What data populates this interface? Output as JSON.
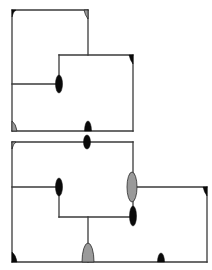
{
  "colors": {
    "background": "#ffffff",
    "line": "#3a3a3a",
    "marker_black": "#0a0a0a",
    "marker_grey": "#9a9a9a"
  },
  "diagrams": [
    {
      "name": "floorplan-top",
      "walls": [
        [
          12,
          10,
          88,
          10
        ],
        [
          12,
          10,
          12,
          131
        ],
        [
          12,
          131,
          133,
          131
        ],
        [
          88,
          10,
          88,
          55
        ],
        [
          59,
          55,
          133,
          55
        ],
        [
          133,
          55,
          133,
          131
        ],
        [
          59,
          55,
          59,
          84
        ],
        [
          12,
          84,
          59,
          84
        ]
      ],
      "markers": [
        {
          "type": "corner",
          "color": "black",
          "x": 12,
          "y": 10,
          "dir": "tl"
        },
        {
          "type": "corner",
          "color": "grey",
          "x": 88,
          "y": 10,
          "dir": "tr"
        },
        {
          "type": "ellipse",
          "color": "black",
          "x": 59,
          "y": 84,
          "rx": 3.5,
          "ry": 9
        },
        {
          "type": "corner",
          "color": "black",
          "x": 133,
          "y": 55,
          "dir": "tr"
        },
        {
          "type": "corner",
          "color": "grey",
          "x": 12,
          "y": 131,
          "dir": "bl"
        },
        {
          "type": "half",
          "color": "black",
          "x": 88,
          "y": 131,
          "rx": 3.5,
          "ry": 10
        }
      ]
    },
    {
      "name": "floorplan-bottom",
      "walls": [
        [
          12,
          142,
          133,
          142
        ],
        [
          12,
          142,
          12,
          262
        ],
        [
          12,
          262,
          207,
          262
        ],
        [
          133,
          142,
          133,
          217
        ],
        [
          12,
          187,
          59,
          187
        ],
        [
          59,
          187,
          59,
          217
        ],
        [
          59,
          217,
          133,
          217
        ],
        [
          133,
          187,
          207,
          187
        ],
        [
          207,
          187,
          207,
          262
        ],
        [
          88,
          217,
          88,
          262
        ]
      ],
      "markers": [
        {
          "type": "corner",
          "color": "grey",
          "x": 12,
          "y": 142,
          "dir": "tl"
        },
        {
          "type": "ellipse",
          "color": "black",
          "x": 87,
          "y": 142,
          "rx": 3.5,
          "ry": 7
        },
        {
          "type": "ellipse",
          "color": "black",
          "x": 59,
          "y": 187,
          "rx": 3.5,
          "ry": 9
        },
        {
          "type": "ellipse",
          "color": "grey",
          "x": 132,
          "y": 187,
          "rx": 5,
          "ry": 15
        },
        {
          "type": "ellipse",
          "color": "black",
          "x": 133,
          "y": 216,
          "rx": 3.5,
          "ry": 10
        },
        {
          "type": "corner",
          "color": "black",
          "x": 207,
          "y": 187,
          "dir": "tr"
        },
        {
          "type": "corner",
          "color": "black",
          "x": 12,
          "y": 262,
          "dir": "bl"
        },
        {
          "type": "half",
          "color": "grey",
          "x": 88,
          "y": 262,
          "rx": 6,
          "ry": 19
        },
        {
          "type": "half",
          "color": "black",
          "x": 161,
          "y": 262,
          "rx": 3.5,
          "ry": 9
        }
      ]
    }
  ]
}
